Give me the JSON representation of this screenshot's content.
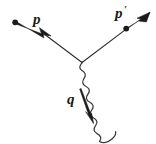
{
  "figure": {
    "kind": "feynman-diagram",
    "background_color": "#ffffff",
    "ink_color": "#1a1a1a"
  },
  "labels": {
    "incoming_momentum": "p",
    "outgoing_momentum": "p",
    "outgoing_momentum_prime": "′",
    "photon_momentum": "q"
  },
  "lines": {
    "incoming_fermion": {
      "name": "p",
      "start_point": [
        15,
        22
      ],
      "vertex_point": [
        82,
        62
      ],
      "arrow_at": [
        43,
        31
      ],
      "style": "solid-tapered",
      "endpoint_dot": true
    },
    "outgoing_fermion": {
      "name": "p′",
      "vertex_point": [
        82,
        62
      ],
      "dot_point": [
        126,
        28
      ],
      "tip_point": [
        149,
        13
      ],
      "style": "solid-tapered",
      "endpoint_dot": true
    },
    "photon": {
      "name": "q",
      "vertex_point": [
        82,
        62
      ],
      "end_point": [
        116,
        141
      ],
      "style": "wavy",
      "wave_amplitude": 4,
      "wave_count": 8
    },
    "photon_momentum_arrow": {
      "name": "q",
      "start_point": [
        80,
        90
      ],
      "tip_point": [
        93,
        123
      ],
      "style": "solid-tapered"
    }
  },
  "label_positions": {
    "p": [
      33,
      22
    ],
    "p_prime": [
      117,
      16
    ],
    "q": [
      68,
      104
    ]
  }
}
